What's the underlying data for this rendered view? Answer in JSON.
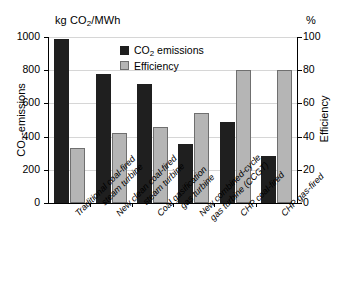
{
  "figure": {
    "unit_left": "kg CO2/MWh",
    "unit_right": "%",
    "axis_title_left": "CO2-emissions",
    "axis_title_right": "Efficiency"
  },
  "chart_data": {
    "type": "bar",
    "title": "",
    "xlabel": "",
    "ylabel": "CO2-emissions",
    "ylabel_right": "Efficiency",
    "yunit": "kg CO2/MWh",
    "yunit_right": "%",
    "ylim": [
      0,
      1000
    ],
    "ylim_right": [
      0,
      100
    ],
    "yticks": [
      0,
      200,
      400,
      600,
      800,
      1000
    ],
    "yticks_right": [
      0,
      20,
      40,
      60,
      80,
      100
    ],
    "grid": true,
    "legend_position": "upper-center",
    "categories": [
      "Traditional coal-fired\nsteam turbine",
      "New clean coal-fired\nsteam turbine",
      "Coal gasification\ngas turbine",
      "New combined-cycle\ngas turbine (CCGT)",
      "CHP coal-fired",
      "CHP gas-fired"
    ],
    "series": [
      {
        "name": "CO2 emissions",
        "axis": "left",
        "unit": "kg CO2/MWh",
        "color": "#1f1f1f",
        "values": [
          990,
          780,
          715,
          355,
          490,
          285
        ]
      },
      {
        "name": "Efficiency",
        "axis": "right",
        "unit": "%",
        "color": "#b5b5b5",
        "values": [
          33,
          42,
          46,
          54,
          80,
          80
        ]
      }
    ]
  }
}
